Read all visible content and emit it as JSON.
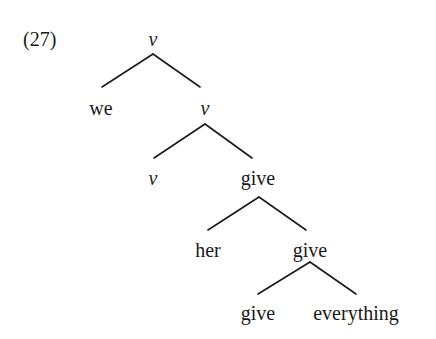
{
  "example_number": "(27)",
  "tree": {
    "nodes": [
      {
        "id": "n0",
        "label": "v",
        "italic": true
      },
      {
        "id": "n1",
        "label": "we",
        "italic": false
      },
      {
        "id": "n2",
        "label": "v",
        "italic": true
      },
      {
        "id": "n3",
        "label": "v",
        "italic": true
      },
      {
        "id": "n4",
        "label": "give",
        "italic": false
      },
      {
        "id": "n5",
        "label": "her",
        "italic": false
      },
      {
        "id": "n6",
        "label": "give",
        "italic": false
      },
      {
        "id": "n7",
        "label": "give",
        "italic": false
      },
      {
        "id": "n8",
        "label": "everything",
        "italic": false
      }
    ],
    "edges": [
      [
        "n0",
        "n1"
      ],
      [
        "n0",
        "n2"
      ],
      [
        "n2",
        "n3"
      ],
      [
        "n2",
        "n4"
      ],
      [
        "n4",
        "n5"
      ],
      [
        "n4",
        "n6"
      ],
      [
        "n6",
        "n7"
      ],
      [
        "n6",
        "n8"
      ]
    ]
  },
  "colors": {
    "text": "#1a1a1a",
    "lines": "#1a1a1a",
    "background": "#ffffff"
  }
}
